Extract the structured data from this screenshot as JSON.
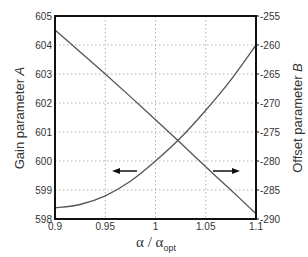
{
  "chart_data": {
    "type": "line",
    "title": "",
    "xlabel": "α / α_opt",
    "xlabel_main": "α / α",
    "xlabel_sub": "opt",
    "ylabel_left": "Gain parameter A",
    "ylabel_left_main": "Gain parameter ",
    "ylabel_left_italic": "A",
    "ylabel_right": "Offset parameter B",
    "ylabel_right_main": "Offset parameter ",
    "ylabel_right_italic": "B",
    "xlim": [
      0.9,
      1.1
    ],
    "ylim_left": [
      598,
      605
    ],
    "ylim_right": [
      -290,
      -255
    ],
    "x_ticks": [
      "0.9",
      "0.95",
      "1",
      "1.05",
      "1.1"
    ],
    "y_ticks_left": [
      "598",
      "599",
      "600",
      "601",
      "602",
      "603",
      "604",
      "605"
    ],
    "y_ticks_right": [
      "-290",
      "-285",
      "-280",
      "-275",
      "-270",
      "-265",
      "-260",
      "-255"
    ],
    "grid": true,
    "grid_style": "dotted",
    "legend": null,
    "annotations": [
      {
        "type": "arrow",
        "direction": "left",
        "meaning": "curve A uses left axis"
      },
      {
        "type": "arrow",
        "direction": "right",
        "meaning": "line B uses right axis"
      }
    ],
    "x": [
      0.9,
      0.925,
      0.95,
      0.975,
      1.0,
      1.025,
      1.05,
      1.075,
      1.1
    ],
    "series": [
      {
        "name": "Gain parameter A",
        "axis": "left",
        "values": [
          598.38,
          598.5,
          598.8,
          599.3,
          600.0,
          600.8,
          601.75,
          602.8,
          604.0
        ]
      },
      {
        "name": "Offset parameter B",
        "axis": "right",
        "values": [
          -257.4,
          -261.2,
          -265.0,
          -268.9,
          -272.9,
          -276.9,
          -281.0,
          -285.0,
          -289.1
        ]
      }
    ]
  },
  "colors": {
    "line": "#555555",
    "frame": "#111111",
    "grid": "#b0b0b0",
    "arrow": "#111111"
  }
}
